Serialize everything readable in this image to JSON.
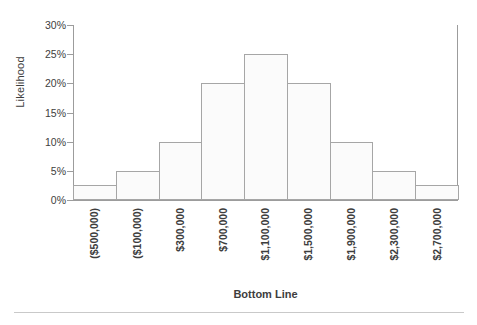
{
  "chart_data": {
    "type": "bar",
    "title": "",
    "xlabel": "Bottom Line",
    "ylabel": "Likelihood",
    "categories": [
      "($500,000)",
      "($100,000)",
      "$300,000",
      "$700,000",
      "$1,100,000",
      "$1,500,000",
      "$1,900,000",
      "$2,300,000",
      "$2,700,000"
    ],
    "values": [
      2.5,
      5,
      10,
      20,
      25,
      20,
      10,
      5,
      2.5
    ],
    "value_unit": "%",
    "ylim": [
      0,
      30
    ],
    "ytick_labels": [
      "0%",
      "5%",
      "10%",
      "15%",
      "20%",
      "25%",
      "30%"
    ],
    "ytick_values": [
      0,
      5,
      10,
      15,
      20,
      25,
      30
    ],
    "grid": false,
    "legend": false,
    "bar_fill_color": "#fbfbfb",
    "bar_border_color": "#a6a6a6",
    "axis_color": "#9c9c9c",
    "text_color": "#3d3d3d",
    "background_color": "#ffffff"
  }
}
